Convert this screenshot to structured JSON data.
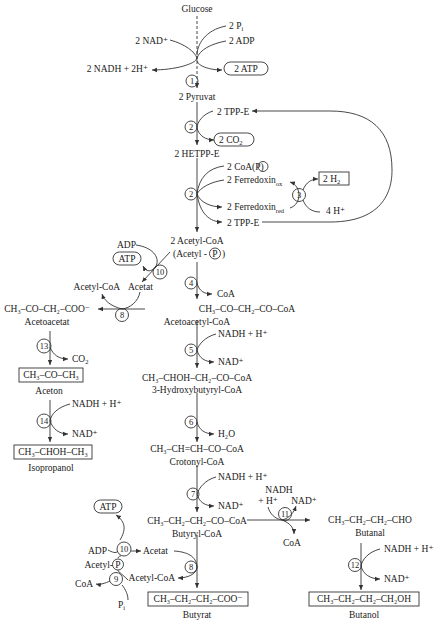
{
  "diagram": {
    "type": "metabolic-pathway"
  },
  "nodes": {
    "glucose": "Glucose",
    "pyruvat": "2 Pyruvat",
    "hetppe": "2 HETPP-E",
    "acetylcoa": "2 Acetyl-CoA",
    "acetylp": "(Acetyl -",
    "acetylp_p": "P",
    "acetylp_close": ")",
    "acetoacetylcoa_formula": "CH₃–CO–CH₂–CO–CoA",
    "acetoacetylcoa": "Acetoacetyl-CoA",
    "acetoacetat_formula": "CH₃–CO–CH₂–COO⁻",
    "acetoacetat": "Acetoacetat",
    "aceton_formula": "CH₃–CO–CH₃",
    "aceton": "Aceton",
    "isopropanol_formula": "CH₃–CHOH–CH₃",
    "isopropanol": "Isopropanol",
    "hydroxybutyryl_formula": "CH₃–CHOH–CH₂–CO–CoA",
    "hydroxybutyryl": "3-Hydroxybutyryl-CoA",
    "crotonyl_formula": "CH₃–CH=CH–CO–CoA",
    "crotonyl": "Crotonyl-CoA",
    "butyryl_formula": "CH₃–CH₂–CH₂–CO–CoA",
    "butyryl": "Butyryl-CoA",
    "butyrat_formula": "CH₃–CH₂–CH₂–COO⁻",
    "butyrat": "Butyrat",
    "butanal_formula": "CH₃–CH₂–CH₂–CHO",
    "butanal": "Butanal",
    "butanol_formula": "CH₃–CH₂–CH₂–CH₂OH",
    "butanol": "Butanol"
  },
  "cofactors": {
    "pi": "2 P",
    "pi_sub": "i",
    "adp2": "2 ADP",
    "nad2": "2 NAD⁺",
    "nadh2": "2 NADH + 2H⁺",
    "atp2": "2 ATP",
    "tppe_in": "2 TPP-E",
    "co2_2": "2 CO",
    "co2_2_sub": "2",
    "coap": "2 CoA(",
    "coap_p": "P",
    "coap_close": ")",
    "fd_ox": "2 Ferredoxin",
    "fd_ox_sub": "ox",
    "fd_red": "2 Ferredoxin",
    "fd_red_sub": "red",
    "tppe_out": "2 TPP-E",
    "h2": "2 H",
    "h2_sub": "2",
    "h4": "4 H⁺",
    "adp_10a": "ADP",
    "atp_10a": "ATP",
    "acetylcoa_8a": "Acetyl-CoA",
    "acetat_8a": "Acetat",
    "coa_4": "CoA",
    "co2_13": "CO",
    "co2_13_sub": "2",
    "nadh_14": "NADH + H⁺",
    "nad_14": "NAD⁺",
    "nadh_5": "NADH + H⁺",
    "nad_5": "NAD⁺",
    "h2o_6": "H₂O",
    "nadh_7": "NADH + H⁺",
    "nad_7": "NAD⁺",
    "nadh_11a": "NADH",
    "nadh_11b": "+ H⁺",
    "nad_11": "NAD⁺",
    "coa_11": "CoA",
    "nadh_12": "NADH + H⁺",
    "nad_12": "NAD⁺",
    "atp_10b": "ATP",
    "adp_10b": "ADP",
    "acetat_8b": "Acetat",
    "acetylp_9": "Acetyl-",
    "acetylp_9_p": "P",
    "coa_9": "CoA",
    "pi_9": "P",
    "pi_9_sub": "i",
    "acetylcoa_8b": "Acetyl-CoA"
  },
  "enzymes": {
    "e1": "1",
    "e2a": "2",
    "e2b": "2",
    "e3": "3",
    "e4": "4",
    "e5": "5",
    "e6": "6",
    "e7": "7",
    "e8a": "8",
    "e8b": "8",
    "e9": "9",
    "e10a": "10",
    "e10b": "10",
    "e11": "11",
    "e12": "12",
    "e13": "13",
    "e14": "14"
  },
  "colors": {
    "ink": "#1a1a1a",
    "line": "#333333",
    "background": "#ffffff"
  }
}
